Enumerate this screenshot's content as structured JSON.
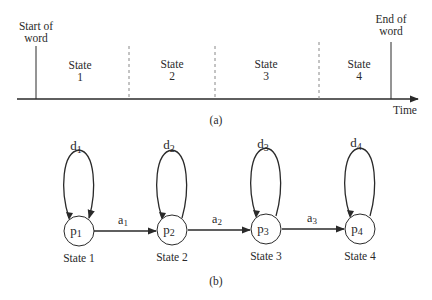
{
  "part_a": {
    "caption": "(a)",
    "start_label": [
      "Start of",
      "word"
    ],
    "end_label": [
      "End of",
      "word"
    ],
    "axis_label": "Time",
    "segments": [
      {
        "title": "State",
        "num": "1"
      },
      {
        "title": "State",
        "num": "2"
      },
      {
        "title": "State",
        "num": "3"
      },
      {
        "title": "State",
        "num": "4"
      }
    ]
  },
  "part_b": {
    "caption": "(b)",
    "states": [
      {
        "node": "p",
        "sub": "1",
        "loop": "d",
        "loop_sub": "1",
        "label": "State 1"
      },
      {
        "node": "p",
        "sub": "2",
        "loop": "d",
        "loop_sub": "2",
        "label": "State 2"
      },
      {
        "node": "p",
        "sub": "3",
        "loop": "d",
        "loop_sub": "3",
        "label": "State 3"
      },
      {
        "node": "p",
        "sub": "4",
        "loop": "d",
        "loop_sub": "4",
        "label": "State 4"
      }
    ],
    "transitions": [
      {
        "sym": "a",
        "sub": "1"
      },
      {
        "sym": "a",
        "sub": "2"
      },
      {
        "sym": "a",
        "sub": "3"
      }
    ]
  },
  "colors": {
    "ink": "#2a2a2a",
    "dash": "#888888",
    "background": "#ffffff"
  }
}
